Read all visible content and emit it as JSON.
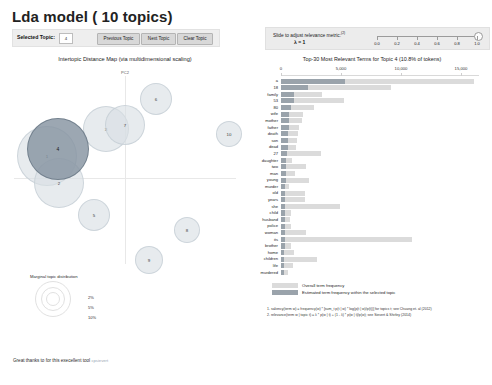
{
  "header": {
    "title": "Lda model ( 10 topics)",
    "selected_topic_label": "Selected Topic:",
    "selected_topic_value": "4",
    "prev_button": "Previous Topic",
    "next_button": "Next Topic",
    "clear_button": "Clear Topic"
  },
  "slider": {
    "label": "Slide to adjust relevance metric:",
    "superscript": "(2)",
    "lambda_text": "λ = 1",
    "ticks": [
      "0.0",
      "0.2",
      "0.4",
      "0.6",
      "0.8",
      "1.0"
    ],
    "value": 1.0
  },
  "left_panel": {
    "title": "Intertopic Distance Map (via multidimensional scaling)",
    "axis_label": "PC2",
    "legend_title": "Marginal topic distribution",
    "ring_labels": [
      "2%",
      "5%",
      "10%"
    ]
  },
  "credit": {
    "text": "Great thanks to for this execellent tool",
    "link": "cpsievert"
  },
  "right_panel": {
    "title": "Top-30 Most Relevant Terms for Topic 4 (10.8% of tokens)",
    "legend_overall": "Overall term frequency",
    "legend_topic": "Estimated term frequency within the selected topic",
    "note1": "1. saliency(term w) = frequency(w) * [sum_t p(t | w) * log(p(t | w)/p(t))] for topics t; see Chuang et. al (2012)",
    "note2": "2. relevance(term w | topic t) = λ * p(w | t) + (1 - λ) * p(w | t)/p(w); see Sievert & Shirley (2014)"
  },
  "chart_data": {
    "type": "bar",
    "title": "Top-30 Most Relevant Terms for Topic 4 (10.8% of tokens)",
    "xlabel": "",
    "ylabel": "",
    "xlim": [
      0,
      16500
    ],
    "xticks": [
      0,
      5000,
      10000,
      15000
    ],
    "xtick_labels": [
      "0",
      "5,000",
      "10,000",
      "15,000"
    ],
    "grid": false,
    "legend": [
      "Overall term frequency",
      "Estimated term frequency within the selected topic"
    ],
    "legend_position": "bottom-left",
    "categories": [
      "a",
      "18",
      "family",
      "53",
      "80",
      "wife",
      "mother",
      "father",
      "death",
      "son",
      "dead",
      "27",
      "daughter",
      "two",
      "man",
      "young",
      "murder",
      "old",
      "years",
      "she",
      "child",
      "husband",
      "police",
      "woman",
      "its",
      "brother",
      "home",
      "children",
      "life",
      "murdered"
    ],
    "series": [
      {
        "name": "Overall term frequency",
        "values": [
          15900,
          9100,
          3400,
          5200,
          2700,
          1800,
          1700,
          1500,
          1400,
          1300,
          1250,
          3300,
          900,
          2100,
          1150,
          2300,
          700,
          2000,
          2000,
          4900,
          800,
          750,
          800,
          2100,
          10800,
          800,
          1100,
          3000,
          950,
          600
        ]
      },
      {
        "name": "Estimated term frequency within the selected topic",
        "values": [
          5300,
          2250,
          1100,
          1050,
          800,
          700,
          680,
          640,
          600,
          580,
          560,
          520,
          430,
          400,
          390,
          380,
          370,
          360,
          350,
          345,
          330,
          320,
          315,
          310,
          300,
          290,
          285,
          280,
          270,
          265
        ]
      }
    ]
  },
  "topics": [
    {
      "id": "4",
      "x": 57,
      "y": 148,
      "r": 30,
      "selected": true
    },
    {
      "id": "1",
      "x": 46,
      "y": 155,
      "r": 29,
      "selected": false
    },
    {
      "id": "2",
      "x": 58,
      "y": 182,
      "r": 24,
      "selected": false
    },
    {
      "id": "3",
      "x": 105,
      "y": 128,
      "r": 22,
      "selected": false
    },
    {
      "id": "7",
      "x": 124,
      "y": 124,
      "r": 19,
      "selected": false
    },
    {
      "id": "6",
      "x": 155,
      "y": 98,
      "r": 15,
      "selected": false
    },
    {
      "id": "10",
      "x": 228,
      "y": 133,
      "r": 12,
      "selected": false
    },
    {
      "id": "5",
      "x": 93,
      "y": 214,
      "r": 15,
      "selected": false
    },
    {
      "id": "8",
      "x": 186,
      "y": 229,
      "r": 12,
      "selected": false
    },
    {
      "id": "9",
      "x": 148,
      "y": 259,
      "r": 13,
      "selected": false
    }
  ]
}
